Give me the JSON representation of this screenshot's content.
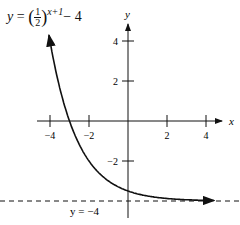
{
  "chart_data": {
    "type": "line",
    "equation": {
      "lhs": "y",
      "base_num": "1",
      "base_den": "2",
      "exponent": "x+1",
      "constant": "− 4"
    },
    "xlabel": "x",
    "ylabel": "y",
    "xlim": [
      -4.5,
      4.5
    ],
    "ylim": [
      -4.8,
      4.6
    ],
    "x_ticks": [
      -4,
      -2,
      2,
      4
    ],
    "x_tick_labels": [
      "−4",
      "−2",
      "2",
      "4"
    ],
    "y_ticks": [
      4,
      2,
      -2
    ],
    "y_tick_labels": [
      "4",
      "2",
      "−2"
    ],
    "series": [
      {
        "name": "y = (1/2)^(x+1) - 4",
        "x": [
          -4,
          -3.5,
          -3,
          -2.5,
          -2,
          -1.5,
          -1,
          0,
          1,
          2,
          3,
          4
        ],
        "y": [
          4,
          1.66,
          0,
          -1.17,
          -2,
          -2.59,
          -3,
          -3.5,
          -3.75,
          -3.88,
          -3.94,
          -3.97
        ]
      }
    ],
    "asymptote": {
      "y": -4,
      "label": "y = −4",
      "style": "dashed"
    },
    "grid": false
  }
}
